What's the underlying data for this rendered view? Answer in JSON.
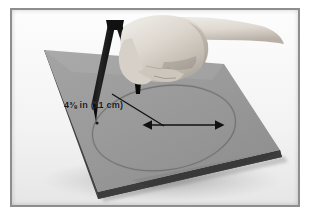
{
  "figure": {
    "kind": "instructional-photograph",
    "color_mode": "black-and-white"
  },
  "annotation": {
    "dimension_text": "4⅜ in (11 cm)",
    "whole_number": "4",
    "fraction": "⅜",
    "unit_imperial": "in",
    "metric_text": "(11 cm)",
    "measures": "radius"
  },
  "colors": {
    "frame_border": "#8e8e8e",
    "page_background": "#ffffff",
    "photo_background": "#f4f4f4",
    "paper_sheet": "#9a9a9a",
    "paper_sheet_shade": "#8a8a8a",
    "paper_edge": "#4a4a4a",
    "compass_body": "#1b1b1b",
    "skin_light": "#e0dcd6",
    "skin_mid": "#c9c3bb",
    "skin_shadow": "#a59d95",
    "arrow": "#101113",
    "pencil_circle": "#6e6e6e"
  },
  "objects": {
    "paper_sheet_label": "gray paper sheet",
    "compass_label": "drawing compass",
    "hand_label": "hand",
    "circle_label": "drawn circle",
    "pivot_label": "compass pivot point",
    "leader_line_label": "leader line",
    "arrow_label": "double-headed dimension arrow",
    "table_surface_label": "white table surface"
  }
}
